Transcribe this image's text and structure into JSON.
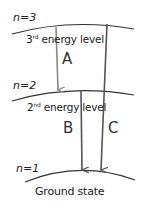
{
  "levels": [
    {
      "n_label": "n=3",
      "name_num": "3",
      "name_sup": "rd",
      "name_rest": " energy level"
    },
    {
      "n_label": "n=2",
      "name_num": "2",
      "name_sup": "nd",
      "name_rest": " energy level"
    },
    {
      "n_label": "n=1",
      "name": "Ground state"
    }
  ],
  "transitions": [
    {
      "label": "A",
      "from": "n=3",
      "to": "n=2",
      "color": "#888888"
    },
    {
      "label": "B",
      "from": "n=2",
      "to": "n=1",
      "color": "#555555"
    },
    {
      "label": "C",
      "from": "n=3",
      "to": "n=1",
      "color": "#555555"
    }
  ]
}
